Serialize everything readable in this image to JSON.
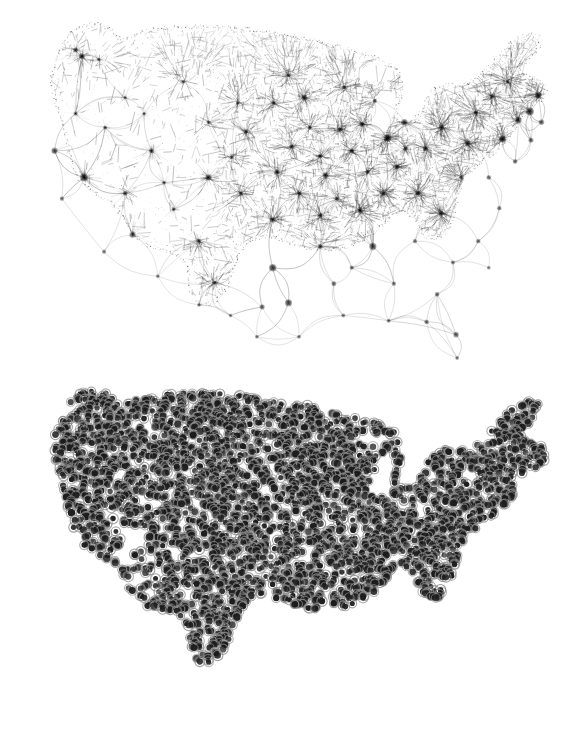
{
  "figure": {
    "title": "",
    "background_color": "#ffffff",
    "width": 571,
    "height": 731,
    "panel_count": 2
  },
  "panels": [
    {
      "id": "network-map",
      "name": "road-network-density-map",
      "caption": "",
      "rendering": "hairline-network",
      "region": {
        "x": 0,
        "y": 0,
        "width": 571,
        "height": 366
      },
      "map_bounds": {
        "x": 25,
        "y": 18,
        "width": 527,
        "height": 340
      },
      "ink_color": "#111111",
      "line_color": "#3a3a3a",
      "line_opacity": 0.3,
      "line_width": 0.35,
      "hub_color": "#000000",
      "edge_count": 5200,
      "hub_count": 190,
      "notes": "fine grey road/route web, dark radial hubs at major metropolitan areas, white voids at great lakes"
    },
    {
      "id": "dot-map",
      "name": "circle-marker-density-map",
      "caption": "",
      "rendering": "overlapping-circle-markers",
      "region": {
        "x": 0,
        "y": 366,
        "width": 571,
        "height": 365
      },
      "map_bounds": {
        "x": 25,
        "y": 385,
        "width": 527,
        "height": 330
      },
      "marker_core_color": "#1c1c1c",
      "marker_ring_color": "#8c8c8c",
      "marker_ring_opacity": 0.85,
      "marker_core_radius": 3.1,
      "marker_ring_radius": 4.6,
      "marker_ring_width": 1.1,
      "marker_count": 2600,
      "notes": "densely packed overlapping dark circles with light grey halo rings, white gaps over great basin and great lakes"
    }
  ],
  "geography": {
    "outline_name": "contiguous-us-silhouette",
    "voids": [
      {
        "name": "lake-michigan",
        "label": "Lake Michigan"
      },
      {
        "name": "lake-superior",
        "label": "Lake Superior"
      },
      {
        "name": "great-basin-gap",
        "label": "Great Basin"
      }
    ],
    "hubs": [
      {
        "name": "new-york",
        "label": "New York",
        "weight": 1.0
      },
      {
        "name": "los-angeles",
        "label": "Los Angeles",
        "weight": 0.95
      },
      {
        "name": "chicago",
        "label": "Chicago",
        "weight": 0.92
      },
      {
        "name": "dallas-fort-worth",
        "label": "Dallas-Fort Worth",
        "weight": 0.88
      },
      {
        "name": "houston",
        "label": "Houston",
        "weight": 0.84
      },
      {
        "name": "atlanta",
        "label": "Atlanta",
        "weight": 0.86
      },
      {
        "name": "philadelphia",
        "label": "Philadelphia",
        "weight": 0.78
      },
      {
        "name": "washington-dc",
        "label": "Washington DC",
        "weight": 0.76
      },
      {
        "name": "boston",
        "label": "Boston",
        "weight": 0.74
      },
      {
        "name": "detroit",
        "label": "Detroit",
        "weight": 0.72
      },
      {
        "name": "minneapolis",
        "label": "Minneapolis",
        "weight": 0.68
      },
      {
        "name": "denver",
        "label": "Denver",
        "weight": 0.7
      },
      {
        "name": "phoenix",
        "label": "Phoenix",
        "weight": 0.7
      },
      {
        "name": "seattle",
        "label": "Seattle",
        "weight": 0.66
      },
      {
        "name": "san-francisco",
        "label": "San Francisco",
        "weight": 0.72
      },
      {
        "name": "miami",
        "label": "Miami",
        "weight": 0.64
      },
      {
        "name": "st-louis",
        "label": "St. Louis",
        "weight": 0.62
      },
      {
        "name": "kansas-city",
        "label": "Kansas City",
        "weight": 0.58
      },
      {
        "name": "salt-lake-city",
        "label": "Salt Lake City",
        "weight": 0.54
      },
      {
        "name": "oklahoma-city",
        "label": "Oklahoma City",
        "weight": 0.54
      },
      {
        "name": "nashville",
        "label": "Nashville",
        "weight": 0.56
      },
      {
        "name": "charlotte",
        "label": "Charlotte",
        "weight": 0.56
      },
      {
        "name": "san-antonio",
        "label": "San Antonio",
        "weight": 0.56
      },
      {
        "name": "new-orleans",
        "label": "New Orleans",
        "weight": 0.52
      },
      {
        "name": "portland",
        "label": "Portland",
        "weight": 0.54
      },
      {
        "name": "pittsburgh",
        "label": "Pittsburgh",
        "weight": 0.56
      },
      {
        "name": "cleveland",
        "label": "Cleveland",
        "weight": 0.58
      },
      {
        "name": "indianapolis",
        "label": "Indianapolis",
        "weight": 0.56
      },
      {
        "name": "memphis",
        "label": "Memphis",
        "weight": 0.52
      },
      {
        "name": "las-vegas",
        "label": "Las Vegas",
        "weight": 0.5
      },
      {
        "name": "albuquerque",
        "label": "Albuquerque",
        "weight": 0.46
      },
      {
        "name": "el-paso",
        "label": "El Paso",
        "weight": 0.46
      },
      {
        "name": "billings",
        "label": "Billings",
        "weight": 0.34
      },
      {
        "name": "boise",
        "label": "Boise",
        "weight": 0.36
      },
      {
        "name": "spokane",
        "label": "Spokane",
        "weight": 0.36
      },
      {
        "name": "fargo",
        "label": "Fargo",
        "weight": 0.34
      },
      {
        "name": "omaha",
        "label": "Omaha",
        "weight": 0.46
      },
      {
        "name": "columbus",
        "label": "Columbus",
        "weight": 0.54
      },
      {
        "name": "jacksonville",
        "label": "Jacksonville",
        "weight": 0.5
      },
      {
        "name": "tampa",
        "label": "Tampa",
        "weight": 0.52
      }
    ]
  },
  "chart_data": {
    "type": "scatter",
    "title": "",
    "subtitle": "",
    "xlabel": "",
    "ylabel": "",
    "legend": [],
    "grid": false,
    "series": [
      {
        "name": "road-network-edges",
        "panel": "network-map",
        "marker": "line",
        "color": "#3a3a3a",
        "count": 5200
      },
      {
        "name": "settlement-markers",
        "panel": "dot-map",
        "marker": "circle",
        "color": "#1c1c1c",
        "count": 2600
      }
    ]
  }
}
